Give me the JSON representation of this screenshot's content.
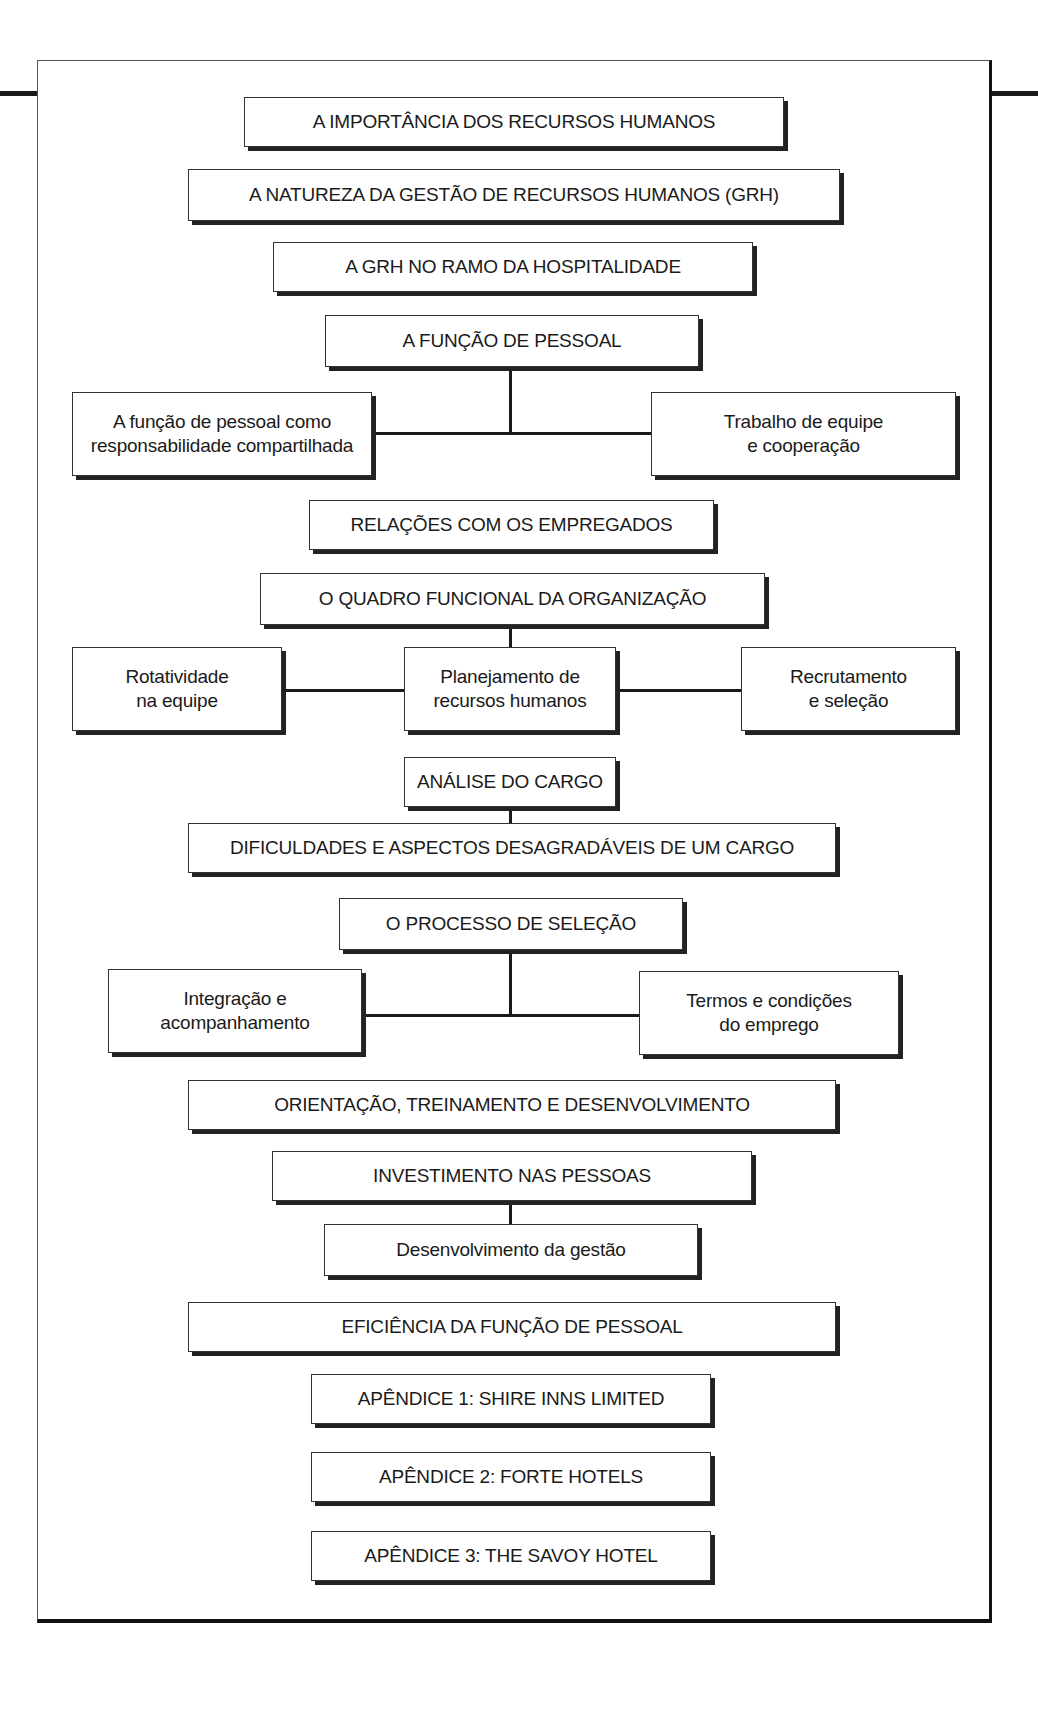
{
  "diagram": {
    "type": "flowchart",
    "title": "",
    "colors": {
      "border": "#333333",
      "shadow": "#222222",
      "connector": "#1a1a1a",
      "background": "#ffffff"
    },
    "nodes": {
      "importancia": "A IMPORTÂNCIA DOS RECURSOS HUMANOS",
      "natureza": "A NATUREZA DA GESTÃO DE RECURSOS HUMANOS (GRH)",
      "grh_hospitalidade": "A GRH NO RAMO DA HOSPITALIDADE",
      "funcao_pessoal": "A FUNÇÃO DE PESSOAL",
      "responsabilidade": "A função de pessoal como\nresponsabilidade compartilhada",
      "trabalho_equipe": "Trabalho de equipe\ne cooperação",
      "relacoes": "RELAÇÕES COM OS EMPREGADOS",
      "quadro_funcional": "O QUADRO FUNCIONAL DA ORGANIZAÇÃO",
      "rotatividade": "Rotatividade\nna equipe",
      "planejamento": "Planejamento de\nrecursos humanos",
      "recrutamento": "Recrutamento\ne seleção",
      "analise_cargo": "ANÁLISE DO CARGO",
      "dificuldades": "DIFICULDADES E ASPECTOS DESAGRADÁVEIS DE UM CARGO",
      "processo_selecao": "O PROCESSO DE SELEÇÃO",
      "integracao": "Integração e\nacompanhamento",
      "termos": "Termos e condições\ndo emprego",
      "orientacao": "ORIENTAÇÃO, TREINAMENTO E DESENVOLVIMENTO",
      "investimento": "INVESTIMENTO NAS PESSOAS",
      "desenvolvimento_gestao": "Desenvolvimento da gestão",
      "eficiencia": "EFICIÊNCIA DA FUNÇÃO DE PESSOAL",
      "apendice1": "APÊNDICE 1: SHIRE INNS LIMITED",
      "apendice2": "APÊNDICE 2: FORTE HOTELS",
      "apendice3": "APÊNDICE 3: THE SAVOY HOTEL"
    },
    "edges": [
      [
        "funcao_pessoal",
        "responsabilidade"
      ],
      [
        "funcao_pessoal",
        "trabalho_equipe"
      ],
      [
        "quadro_funcional",
        "planejamento"
      ],
      [
        "planejamento",
        "rotatividade"
      ],
      [
        "planejamento",
        "recrutamento"
      ],
      [
        "analise_cargo",
        "dificuldades"
      ],
      [
        "processo_selecao",
        "integracao"
      ],
      [
        "processo_selecao",
        "termos"
      ],
      [
        "investimento",
        "desenvolvimento_gestao"
      ]
    ]
  }
}
